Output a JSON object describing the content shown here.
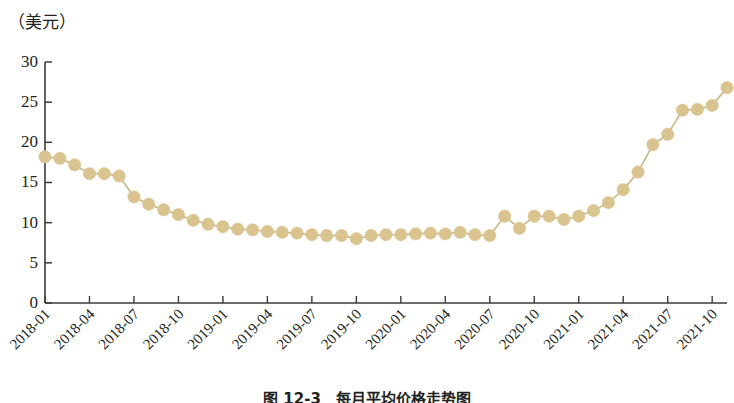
{
  "figure": {
    "unit_label": "（美元）",
    "caption": "图 12-3　每月平均价格走势图"
  },
  "chart_data": {
    "type": "line",
    "title": "",
    "subtitle": "",
    "xlabel": "",
    "ylabel": "（美元）",
    "ylim": [
      0,
      30
    ],
    "yticks": [
      0,
      5,
      10,
      15,
      20,
      25,
      30
    ],
    "grid": false,
    "legend": "none",
    "marker": "circle",
    "marker_color": "#d9c38f",
    "line_color": "#cbb484",
    "axis_color": "#3b3b3b",
    "xtick_labels": [
      "2018-01",
      "2018-04",
      "2018-07",
      "2018-10",
      "2019-01",
      "2019-04",
      "2019-07",
      "2019-10",
      "2020-01",
      "2020-04",
      "2020-07",
      "2020-10",
      "2021-01",
      "2021-04",
      "2021-07",
      "2021-10"
    ],
    "x": [
      "2018-01",
      "2018-02",
      "2018-03",
      "2018-04",
      "2018-05",
      "2018-06",
      "2018-07",
      "2018-08",
      "2018-09",
      "2018-10",
      "2018-11",
      "2018-12",
      "2019-01",
      "2019-02",
      "2019-03",
      "2019-04",
      "2019-05",
      "2019-06",
      "2019-07",
      "2019-08",
      "2019-09",
      "2019-10",
      "2019-11",
      "2019-12",
      "2020-01",
      "2020-02",
      "2020-03",
      "2020-04",
      "2020-05",
      "2020-06",
      "2020-07",
      "2020-08",
      "2020-09",
      "2020-10",
      "2020-11",
      "2020-12",
      "2021-01",
      "2021-02",
      "2021-03",
      "2021-04",
      "2021-05",
      "2021-06",
      "2021-07",
      "2021-08",
      "2021-09",
      "2021-10",
      "2021-11"
    ],
    "values": [
      18.2,
      18.0,
      17.2,
      16.1,
      16.1,
      15.8,
      13.2,
      12.3,
      11.6,
      11.0,
      10.3,
      9.8,
      9.5,
      9.2,
      9.1,
      8.9,
      8.8,
      8.7,
      8.5,
      8.4,
      8.4,
      8.0,
      8.4,
      8.5,
      8.5,
      8.6,
      8.7,
      8.6,
      8.8,
      8.5,
      8.4,
      10.8,
      9.3,
      10.8,
      10.8,
      10.4,
      10.8,
      11.5,
      12.5,
      14.1,
      16.3,
      19.7,
      21.0,
      24.0,
      24.1,
      24.6,
      26.8
    ]
  }
}
